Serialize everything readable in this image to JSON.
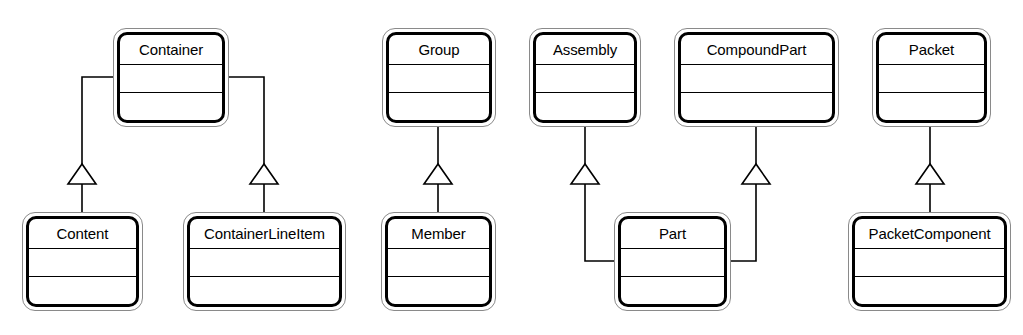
{
  "diagram": {
    "kind": "uml-class-diagram",
    "notation": "generalization",
    "canvas": {
      "width": 1023,
      "height": 335
    },
    "colors": {
      "background": "#ffffff",
      "box_outline": "#000000",
      "box_shadow_outline": "#8a8a8a",
      "edge": "#000000",
      "text": "#000000",
      "arrowhead_fill": "#ffffff"
    }
  },
  "classes": [
    {
      "id": "container",
      "name": "Container",
      "x": 113,
      "y": 28,
      "w": 116,
      "h": 99,
      "row": "top"
    },
    {
      "id": "group",
      "name": "Group",
      "x": 382,
      "y": 28,
      "w": 114,
      "h": 99,
      "row": "top"
    },
    {
      "id": "assembly",
      "name": "Assembly",
      "x": 529,
      "y": 28,
      "w": 112,
      "h": 99,
      "row": "top"
    },
    {
      "id": "compoundpart",
      "name": "CompoundPart",
      "x": 674,
      "y": 28,
      "w": 165,
      "h": 99,
      "row": "top"
    },
    {
      "id": "packet",
      "name": "Packet",
      "x": 872,
      "y": 28,
      "w": 119,
      "h": 99,
      "row": "top"
    },
    {
      "id": "content",
      "name": "Content",
      "x": 22,
      "y": 212,
      "w": 121,
      "h": 99,
      "row": "bottom"
    },
    {
      "id": "containerlineitem",
      "name": "ContainerLineItem",
      "x": 183,
      "y": 212,
      "w": 163,
      "h": 99,
      "row": "bottom"
    },
    {
      "id": "member",
      "name": "Member",
      "x": 381,
      "y": 212,
      "w": 115,
      "h": 99,
      "row": "bottom"
    },
    {
      "id": "part",
      "name": "Part",
      "x": 614,
      "y": 212,
      "w": 117,
      "h": 99,
      "row": "bottom"
    },
    {
      "id": "packetcomponent",
      "name": "PacketComponent",
      "x": 848,
      "y": 212,
      "w": 163,
      "h": 99,
      "row": "bottom"
    }
  ],
  "generalizations": [
    {
      "id": "content-to-container",
      "subclass": "Content",
      "superclass": "Container"
    },
    {
      "id": "containerlineitem-to-container",
      "subclass": "ContainerLineItem",
      "superclass": "Container"
    },
    {
      "id": "member-to-group",
      "subclass": "Member",
      "superclass": "Group"
    },
    {
      "id": "part-to-assembly",
      "subclass": "Part",
      "superclass": "Assembly"
    },
    {
      "id": "part-to-compoundpart",
      "subclass": "Part",
      "superclass": "CompoundPart"
    },
    {
      "id": "packetcomponent-to-packet",
      "subclass": "PacketComponent",
      "superclass": "Packet"
    }
  ]
}
